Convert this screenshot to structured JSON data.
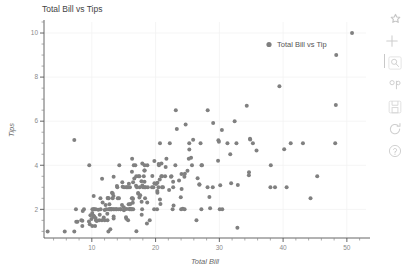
{
  "chart_data": {
    "type": "scatter",
    "title": "Total Bill vs Tips",
    "xlabel": "Total Bill",
    "ylabel": "Tips",
    "xlim": [
      2.5,
      53
    ],
    "ylim": [
      0.7,
      10.5
    ],
    "xticks": [
      "10",
      "20",
      "30",
      "40",
      "50"
    ],
    "xtick_values": [
      10,
      20,
      30,
      40,
      50
    ],
    "yticks": [
      "2",
      "4",
      "6",
      "8",
      "10"
    ],
    "ytick_values": [
      2,
      4,
      6,
      8,
      10
    ],
    "grid": true,
    "legend": {
      "position": "top-right",
      "entries": [
        {
          "name": "Total Bill vs Tip",
          "color": "#7f7f7f",
          "marker": "circle"
        }
      ]
    },
    "marker": {
      "color": "#808080",
      "size": 3,
      "symbol": "circle"
    },
    "series": [
      {
        "name": "Total Bill vs Tip",
        "x": [
          16.99,
          10.34,
          21.01,
          23.68,
          24.59,
          25.29,
          8.77,
          26.88,
          15.04,
          14.78,
          10.27,
          35.26,
          15.42,
          18.43,
          14.83,
          21.58,
          10.33,
          16.29,
          16.97,
          20.65,
          17.92,
          20.29,
          15.77,
          39.42,
          19.82,
          17.81,
          13.37,
          12.69,
          21.7,
          19.65,
          9.55,
          18.35,
          15.06,
          20.69,
          17.78,
          24.06,
          16.31,
          16.93,
          18.69,
          31.27,
          16.04,
          17.46,
          13.94,
          9.68,
          30.4,
          18.29,
          22.23,
          32.4,
          28.55,
          18.04,
          12.54,
          10.29,
          34.81,
          9.94,
          25.56,
          19.49,
          38.01,
          26.41,
          11.24,
          48.27,
          20.29,
          13.81,
          11.02,
          18.29,
          17.59,
          20.08,
          16.45,
          3.07,
          20.23,
          15.01,
          12.02,
          17.07,
          26.86,
          25.28,
          14.73,
          10.51,
          17.92,
          27.2,
          22.76,
          17.29,
          19.44,
          16.66,
          10.07,
          32.68,
          15.98,
          34.83,
          13.03,
          18.28,
          24.71,
          21.16,
          28.97,
          22.49,
          5.75,
          16.32,
          22.75,
          40.17,
          27.28,
          12.03,
          21.01,
          12.46,
          11.35,
          15.38,
          44.3,
          22.42,
          20.92,
          15.36,
          20.49,
          25.21,
          18.24,
          14.31,
          14.0,
          7.25,
          38.07,
          23.95,
          25.71,
          17.31,
          29.93,
          10.65,
          12.43,
          24.08,
          11.69,
          13.42,
          14.26,
          15.95,
          12.48,
          29.8,
          8.52,
          14.52,
          11.38,
          22.82,
          19.08,
          20.27,
          11.17,
          12.26,
          18.26,
          8.51,
          10.33,
          14.15,
          16.0,
          13.16,
          17.47,
          34.3,
          41.19,
          27.05,
          16.43,
          8.35,
          18.64,
          11.87,
          9.78,
          7.51,
          14.07,
          13.13,
          17.26,
          24.55,
          19.77,
          29.85,
          48.17,
          25.0,
          13.39,
          16.49,
          21.5,
          12.66,
          16.21,
          13.81,
          17.51,
          24.52,
          20.76,
          31.71,
          10.59,
          10.63,
          50.81,
          15.81,
          7.25,
          31.85,
          16.82,
          32.9,
          17.89,
          14.48,
          9.6,
          34.63,
          34.65,
          23.33,
          45.35,
          23.17,
          40.55,
          20.69,
          20.9,
          30.46,
          18.15,
          23.1,
          15.69,
          19.81,
          28.44,
          15.48,
          16.58,
          7.56,
          10.34,
          43.11,
          13.0,
          13.51,
          18.71,
          12.74,
          13.0,
          16.4,
          20.53,
          16.47,
          26.59,
          38.73,
          24.27,
          12.76,
          30.06,
          25.89,
          48.33,
          13.27,
          28.17,
          12.9,
          28.15,
          11.59,
          7.74,
          30.14,
          12.16,
          13.42,
          8.58,
          15.98,
          13.42,
          16.27,
          10.09,
          20.45,
          13.28,
          22.12,
          24.01,
          15.69,
          11.61,
          10.77,
          15.53,
          10.07,
          12.6,
          32.83,
          35.83,
          29.03,
          27.18,
          22.67,
          17.82,
          18.78
        ],
        "y": [
          1.01,
          1.66,
          3.5,
          3.31,
          3.61,
          4.71,
          2.0,
          3.12,
          1.96,
          3.23,
          1.71,
          5.0,
          1.57,
          3.0,
          3.02,
          3.92,
          1.67,
          3.71,
          3.5,
          3.35,
          4.08,
          2.75,
          2.23,
          7.58,
          3.18,
          2.34,
          2.0,
          2.0,
          4.3,
          3.0,
          1.45,
          2.5,
          3.0,
          2.45,
          3.27,
          3.6,
          2.0,
          3.07,
          2.31,
          5.0,
          2.24,
          2.54,
          3.06,
          1.32,
          5.6,
          3.0,
          5.0,
          6.0,
          2.05,
          3.0,
          2.5,
          2.6,
          5.2,
          1.56,
          4.34,
          3.51,
          3.0,
          1.5,
          1.76,
          6.73,
          3.21,
          2.0,
          1.98,
          3.76,
          2.64,
          3.15,
          2.47,
          1.0,
          2.01,
          2.09,
          1.97,
          3.0,
          3.14,
          5.0,
          2.2,
          1.25,
          3.08,
          4.0,
          3.0,
          2.71,
          3.0,
          3.4,
          1.83,
          5.0,
          2.03,
          5.17,
          2.0,
          4.0,
          5.85,
          3.0,
          3.0,
          3.5,
          1.0,
          4.3,
          3.25,
          4.73,
          4.0,
          1.5,
          3.0,
          1.5,
          2.5,
          3.0,
          2.5,
          3.48,
          4.08,
          1.64,
          4.06,
          4.29,
          3.76,
          4.0,
          3.0,
          1.0,
          4.0,
          2.55,
          4.0,
          3.5,
          5.07,
          1.5,
          1.8,
          2.92,
          2.31,
          1.68,
          2.5,
          2.0,
          2.52,
          4.2,
          1.48,
          2.0,
          2.0,
          2.18,
          1.5,
          2.83,
          1.5,
          2.0,
          3.25,
          1.25,
          2.0,
          2.0,
          2.0,
          2.75,
          3.5,
          6.7,
          5.0,
          5.0,
          2.3,
          1.5,
          1.36,
          1.63,
          1.73,
          2.0,
          2.5,
          2.0,
          2.74,
          2.0,
          2.0,
          5.14,
          5.0,
          3.75,
          2.61,
          2.0,
          3.5,
          2.5,
          2.0,
          2.0,
          3.0,
          3.48,
          2.24,
          4.5,
          1.61,
          2.0,
          10.0,
          3.16,
          5.15,
          3.18,
          4.0,
          3.11,
          2.0,
          2.0,
          4.0,
          3.55,
          3.68,
          5.65,
          3.5,
          6.5,
          3.0,
          5.0,
          3.5,
          2.0,
          3.5,
          4.0,
          1.5,
          4.19,
          2.56,
          2.02,
          4.0,
          1.44,
          2.0,
          5.0,
          2.0,
          2.0,
          4.0,
          2.01,
          2.0,
          2.5,
          4.0,
          3.23,
          3.41,
          3.0,
          2.03,
          2.23,
          2.0,
          5.16,
          9.0,
          2.5,
          6.5,
          1.1,
          3.0,
          1.5,
          1.44,
          3.09,
          2.2,
          3.48,
          1.92,
          3.0,
          1.58,
          2.5,
          2.0,
          3.0,
          2.72,
          2.88,
          2.0,
          3.0,
          3.39,
          1.47,
          3.0,
          1.25,
          1.0,
          1.17,
          4.67,
          5.92,
          2.0,
          2.0,
          1.75,
          3.0
        ]
      }
    ]
  },
  "modebar": {
    "buttons": [
      {
        "name": "plotly-logo-icon",
        "label": "Produced with Plotly"
      },
      {
        "name": "crosshair-icon",
        "label": "Crosshair"
      },
      {
        "name": "zoom-icon",
        "label": "Zoom"
      },
      {
        "name": "pan-icon",
        "label": "Pan"
      },
      {
        "name": "save-icon",
        "label": "Download plot as a png"
      },
      {
        "name": "reset-icon",
        "label": "Reset axes"
      },
      {
        "name": "help-icon",
        "label": "Help"
      }
    ]
  }
}
